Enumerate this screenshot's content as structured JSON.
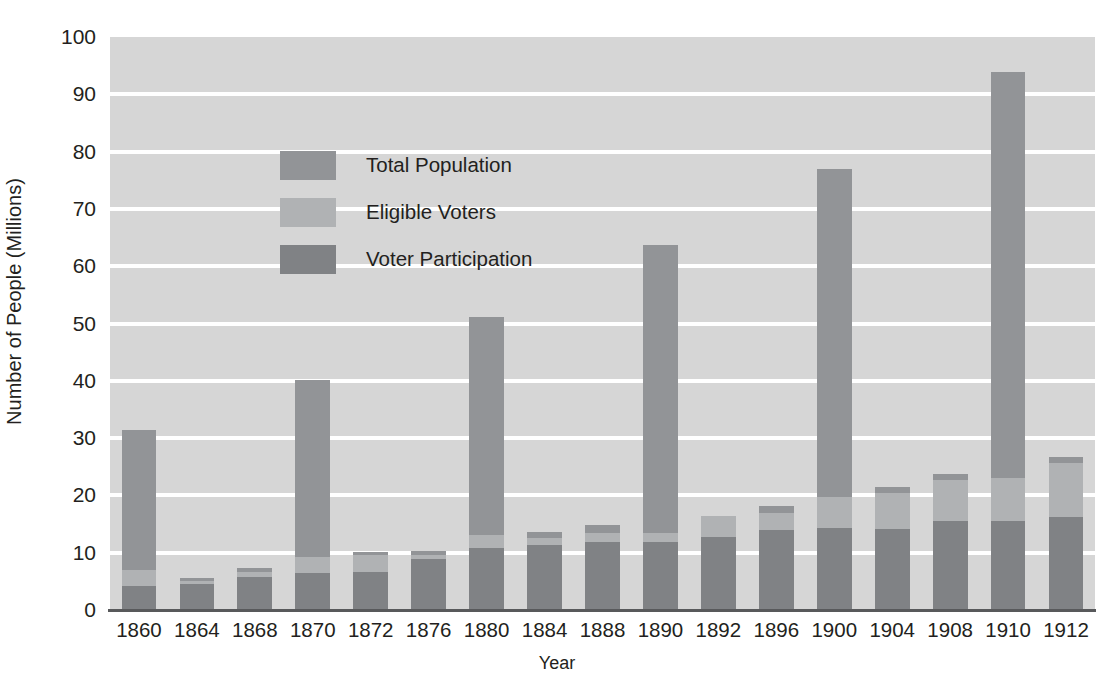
{
  "chart_data": {
    "type": "bar",
    "title": "",
    "xlabel": "Year",
    "ylabel": "Number of People (Millions)",
    "ylim": [
      0,
      100
    ],
    "ytick_values": [
      0,
      10,
      20,
      30,
      40,
      50,
      60,
      70,
      80,
      90,
      100
    ],
    "ytick_labels": [
      "0",
      "10",
      "20",
      "30",
      "40",
      "50",
      "60",
      "70",
      "80",
      "90",
      "100"
    ],
    "grid": true,
    "grid_axis": "y",
    "legend_position": "upper-left",
    "stacked": true,
    "categories": [
      "1860",
      "1864",
      "1868",
      "1870",
      "1872",
      "1876",
      "1880",
      "1884",
      "1888",
      "1890",
      "1892",
      "1896",
      "1900",
      "1904",
      "1908",
      "1910",
      "1912"
    ],
    "series": [
      {
        "name": "Total Population",
        "color": "#929497",
        "values": [
          31.4,
          5.6,
          7.3,
          40.2,
          10.2,
          10.3,
          51.1,
          13.6,
          14.9,
          63.7,
          16.4,
          18.1,
          77.0,
          21.5,
          23.7,
          93.9,
          26.7
        ]
      },
      {
        "name": "Eligible Voters",
        "color": "#b0b2b4",
        "values": [
          6.9,
          5.0,
          6.6,
          9.2,
          9.6,
          9.6,
          13.1,
          12.6,
          13.5,
          13.5,
          16.4,
          17.0,
          19.7,
          20.4,
          22.6,
          23.1,
          25.7
        ]
      },
      {
        "name": "Voter Participation",
        "color": "#808285",
        "values": [
          4.2,
          4.6,
          5.7,
          6.5,
          6.6,
          8.9,
          10.8,
          11.4,
          11.9,
          11.9,
          12.7,
          13.9,
          14.3,
          14.1,
          15.5,
          15.5,
          16.2
        ]
      }
    ],
    "legend": [
      {
        "label": "Total Population",
        "color": "#929497"
      },
      {
        "label": "Eligible Voters",
        "color": "#b0b2b4"
      },
      {
        "label": "Voter Participation",
        "color": "#808285"
      }
    ],
    "colors": {
      "plot_background": "#d6d6d6",
      "gridline": "#ffffff",
      "axis": "#58595b",
      "text": "#231f20",
      "page_background": "#ffffff"
    }
  }
}
